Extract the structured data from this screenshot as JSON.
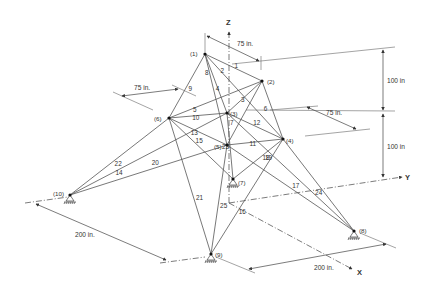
{
  "axes": {
    "z_label": "Z",
    "y_label": "Y",
    "x_label": "X"
  },
  "dimensions": {
    "top_width": "75 in.",
    "top_depth": "75 in.",
    "mid_width": "75 in.",
    "upper_height": "100 in",
    "lower_height": "100 in",
    "base_left": "200 in.",
    "base_right": "200 in."
  },
  "nodes": [
    {
      "id": "1",
      "label": "(1)",
      "x": 205,
      "y": 54
    },
    {
      "id": "2",
      "label": "(2)",
      "x": 262,
      "y": 81
    },
    {
      "id": "3",
      "label": "(3)",
      "x": 227,
      "y": 113
    },
    {
      "id": "4",
      "label": "(4)",
      "x": 283,
      "y": 139
    },
    {
      "id": "5",
      "label": "(5)",
      "x": 227,
      "y": 145
    },
    {
      "id": "6",
      "label": "(6)",
      "x": 169,
      "y": 118
    },
    {
      "id": "7",
      "label": "(7)",
      "x": 233,
      "y": 179
    },
    {
      "id": "8",
      "label": "(8)",
      "x": 354,
      "y": 231
    },
    {
      "id": "9",
      "label": "(9)",
      "x": 211,
      "y": 254
    },
    {
      "id": "10",
      "label": "(10)",
      "x": 70,
      "y": 195
    }
  ],
  "members": [
    {
      "label": "1",
      "from": "1",
      "to": "2"
    },
    {
      "label": "2",
      "from": "1",
      "to": "4"
    },
    {
      "label": "3",
      "from": "2",
      "to": "3"
    },
    {
      "label": "4",
      "from": "1",
      "to": "5"
    },
    {
      "label": "5",
      "from": "2",
      "to": "6"
    },
    {
      "label": "6",
      "from": "2",
      "to": "4"
    },
    {
      "label": "7",
      "from": "2",
      "to": "5"
    },
    {
      "label": "8",
      "from": "1",
      "to": "3"
    },
    {
      "label": "9",
      "from": "1",
      "to": "6"
    },
    {
      "label": "10",
      "from": "3",
      "to": "6"
    },
    {
      "label": "11",
      "from": "4",
      "to": "5"
    },
    {
      "label": "12",
      "from": "3",
      "to": "4"
    },
    {
      "label": "13",
      "from": "5",
      "to": "6"
    },
    {
      "label": "14",
      "from": "3",
      "to": "10"
    },
    {
      "label": "15",
      "from": "6",
      "to": "7"
    },
    {
      "label": "16",
      "from": "4",
      "to": "9"
    },
    {
      "label": "17",
      "from": "5",
      "to": "8"
    },
    {
      "label": "18",
      "from": "4",
      "to": "7"
    },
    {
      "label": "19",
      "from": "3",
      "to": "8"
    },
    {
      "label": "20",
      "from": "5",
      "to": "10"
    },
    {
      "label": "21",
      "from": "6",
      "to": "9"
    },
    {
      "label": "22",
      "from": "6",
      "to": "10"
    },
    {
      "label": "23",
      "from": "3",
      "to": "7"
    },
    {
      "label": "24",
      "from": "4",
      "to": "8"
    },
    {
      "label": "25",
      "from": "5",
      "to": "9"
    }
  ],
  "supports": [
    "7",
    "8",
    "9",
    "10"
  ]
}
